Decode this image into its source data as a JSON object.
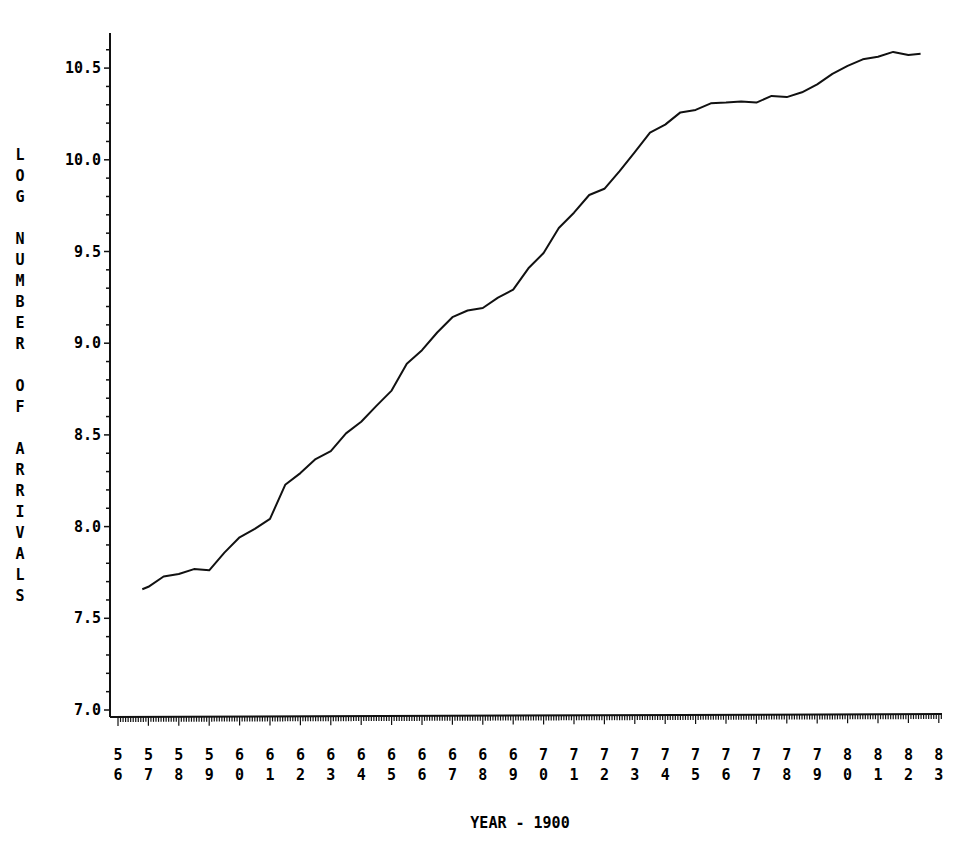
{
  "chart_data": {
    "type": "line",
    "title": "",
    "xlabel": "YEAR - 1900",
    "ylabel": "LOG NUMBER OF ARRIVALS",
    "xlim": [
      56,
      83
    ],
    "ylim": [
      7.0,
      10.6
    ],
    "x_ticks": [
      "56",
      "57",
      "58",
      "59",
      "60",
      "61",
      "62",
      "63",
      "64",
      "65",
      "66",
      "67",
      "68",
      "69",
      "70",
      "71",
      "72",
      "73",
      "74",
      "75",
      "76",
      "77",
      "78",
      "79",
      "80",
      "81",
      "82",
      "83"
    ],
    "y_ticks": [
      "7.0",
      "7.5",
      "8.0",
      "8.5",
      "9.0",
      "9.5",
      "10.0",
      "10.5"
    ],
    "grid": false,
    "legend": null,
    "series": [
      {
        "name": "log arrivals",
        "x": [
          56.8,
          57.0,
          57.5,
          58.0,
          58.5,
          59.0,
          59.5,
          60.0,
          60.5,
          61.0,
          61.5,
          62.0,
          62.5,
          63.0,
          63.5,
          64.0,
          64.5,
          65.0,
          65.5,
          66.0,
          66.5,
          67.0,
          67.5,
          68.0,
          68.5,
          69.0,
          69.5,
          70.0,
          70.5,
          71.0,
          71.5,
          72.0,
          72.5,
          73.0,
          73.5,
          74.0,
          74.5,
          75.0,
          75.5,
          76.0,
          76.5,
          77.0,
          77.5,
          78.0,
          78.5,
          79.0,
          79.5,
          80.0,
          80.5,
          81.0,
          81.5,
          82.0,
          82.4
        ],
        "values": [
          7.65,
          7.68,
          7.72,
          7.75,
          7.76,
          7.77,
          7.85,
          7.95,
          7.98,
          8.05,
          8.22,
          8.3,
          8.36,
          8.42,
          8.5,
          8.58,
          8.65,
          8.75,
          8.88,
          8.97,
          9.05,
          9.15,
          9.17,
          9.2,
          9.24,
          9.3,
          9.4,
          9.5,
          9.62,
          9.72,
          9.8,
          9.85,
          9.93,
          10.05,
          10.14,
          10.2,
          10.25,
          10.28,
          10.3,
          10.32,
          10.31,
          10.32,
          10.34,
          10.35,
          10.36,
          10.42,
          10.46,
          10.52,
          10.54,
          10.57,
          10.58,
          10.58,
          10.57
        ]
      }
    ]
  }
}
